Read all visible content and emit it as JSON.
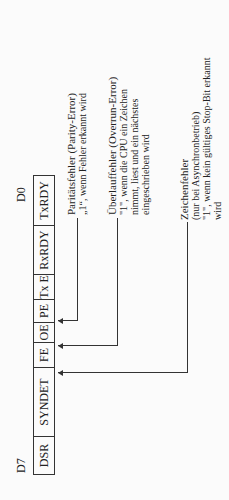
{
  "register": {
    "msb_label": "D7",
    "lsb_label": "D0",
    "bits": [
      {
        "name": "DSR",
        "width": 38
      },
      {
        "name": "SYNDET",
        "width": 69
      },
      {
        "name": "FE",
        "width": 25
      },
      {
        "name": "OE",
        "width": 20
      },
      {
        "name": "PE",
        "width": 23
      },
      {
        "name": "Tx E",
        "width": 25
      },
      {
        "name": "RxRDY",
        "width": 49
      },
      {
        "name": "TxRDY",
        "width": 49
      }
    ]
  },
  "descriptions": [
    {
      "bit": "PE",
      "lines": [
        "Paritätsfehler (Parity-Error)",
        "„1“, wenn Fehler erkannt wird"
      ]
    },
    {
      "bit": "OE",
      "lines": [
        "Überlauffehler (Overrun-Error)",
        "\"1\", wenn die CPU ein Zeichen",
        "nimmt, liest und ein nächstes",
        "eingeschrieben wird"
      ]
    },
    {
      "bit": "FE",
      "lines": [
        "Zeichenfehler",
        "(nur bei Asynchronbetrieb)",
        "\"1\", wenn kein gültiges Stop-Bit erkannt",
        "wird"
      ]
    }
  ]
}
